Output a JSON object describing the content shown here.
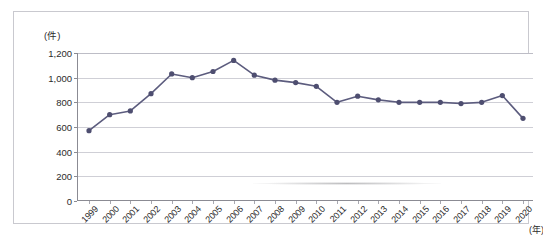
{
  "chart_data": {
    "type": "line",
    "title": "",
    "xlabel": "(年)",
    "ylabel": "(件)",
    "unit_top_label": "(件)",
    "unit_right_label": "(年)",
    "categories": [
      "1999",
      "2000",
      "2001",
      "2002",
      "2003",
      "2004",
      "2005",
      "2006",
      "2007",
      "2008",
      "2009",
      "2010",
      "2011",
      "2012",
      "2013",
      "2014",
      "2015",
      "2016",
      "2017",
      "2018",
      "2019",
      "2020"
    ],
    "values": [
      570,
      700,
      730,
      870,
      1030,
      1000,
      1050,
      1140,
      1020,
      980,
      960,
      930,
      800,
      850,
      820,
      800,
      800,
      800,
      790,
      800,
      855,
      670
    ],
    "ylim": [
      0,
      1200
    ],
    "ytick_labels": [
      "0",
      "200",
      "400",
      "600",
      "800",
      "1,000",
      "1,200"
    ],
    "ytick_values": [
      0,
      200,
      400,
      600,
      800,
      1000,
      1200
    ],
    "grid": true,
    "legend": "none",
    "series_name": "",
    "colors": {
      "line": "#5c5c7e",
      "marker": "#4e4e70",
      "gridline": "#cfcfd6",
      "axis": "#8b8b93",
      "frame": "#c9c9cf",
      "text": "#2b2b2b",
      "background": "#ffffff"
    }
  }
}
